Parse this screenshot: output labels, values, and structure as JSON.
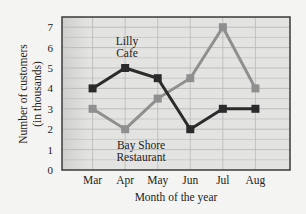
{
  "chart_data": {
    "type": "line",
    "title": "",
    "xlabel": "Month of the year",
    "ylabel": "Number of customers (in thousands)",
    "ylabel_lines": [
      "Number of customers",
      "(in thousands)"
    ],
    "categories": [
      "Mar",
      "Apr",
      "May",
      "Jun",
      "Jul",
      "Aug"
    ],
    "yticks": [
      0,
      1,
      2,
      3,
      4,
      5,
      6,
      7
    ],
    "ylim": [
      0,
      7.5
    ],
    "grid": true,
    "legend_position": "inline annotations",
    "series": [
      {
        "name": "Lilly Cafe",
        "label_lines": [
          "Lilly",
          "Cafe"
        ],
        "color": "#2b2b2b",
        "values": [
          4,
          5,
          4.5,
          2,
          3,
          3
        ]
      },
      {
        "name": "Bay Shore Restaurant",
        "label_lines": [
          "Bay Shore",
          "Restaurant"
        ],
        "color": "#8f8f8f",
        "values": [
          3,
          2,
          3.5,
          4.5,
          7,
          4
        ]
      }
    ]
  },
  "colors": {
    "plot_bg": "#e3e3e1",
    "grid": "#b9b9b7",
    "frame": "#3a3a3a"
  }
}
